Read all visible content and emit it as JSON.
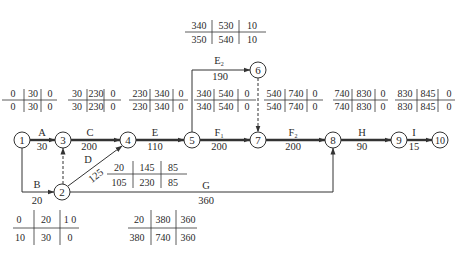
{
  "diagram": {
    "type": "activity-on-arrow network with time parameters",
    "nodes": [
      {
        "id": "1",
        "x": 22,
        "y": 140
      },
      {
        "id": "2",
        "x": 62,
        "y": 192
      },
      {
        "id": "3",
        "x": 63,
        "y": 140
      },
      {
        "id": "4",
        "x": 128,
        "y": 140
      },
      {
        "id": "5",
        "x": 192,
        "y": 140
      },
      {
        "id": "6",
        "x": 258,
        "y": 70
      },
      {
        "id": "7",
        "x": 258,
        "y": 140
      },
      {
        "id": "8",
        "x": 333,
        "y": 140
      },
      {
        "id": "9",
        "x": 399,
        "y": 140
      },
      {
        "id": "10",
        "x": 440,
        "y": 140
      }
    ],
    "activities": [
      {
        "name": "A",
        "duration": "30",
        "from": "1",
        "to": "3",
        "critical": true
      },
      {
        "name": "B",
        "duration": "20",
        "from": "1",
        "to": "2",
        "critical": false
      },
      {
        "name": "C",
        "duration": "200",
        "from": "3",
        "to": "4",
        "critical": true
      },
      {
        "name": "D",
        "duration": "125",
        "from": "2",
        "to": "4",
        "critical": false
      },
      {
        "name": "E",
        "duration": "110",
        "from": "4",
        "to": "5",
        "critical": true
      },
      {
        "name": "E2",
        "duration": "190",
        "from": "5",
        "to": "6",
        "critical": false
      },
      {
        "name": "F1",
        "duration": "200",
        "from": "5",
        "to": "7",
        "critical": true
      },
      {
        "name": "F2",
        "duration": "200",
        "from": "7",
        "to": "8",
        "critical": true
      },
      {
        "name": "G",
        "duration": "360",
        "from": "2",
        "to": "8",
        "critical": false
      },
      {
        "name": "H",
        "duration": "90",
        "from": "8",
        "to": "9",
        "critical": true
      },
      {
        "name": "I",
        "duration": "15",
        "from": "9",
        "to": "10",
        "critical": true
      }
    ],
    "dummies": [
      {
        "from": "2",
        "to": "3"
      },
      {
        "from": "6",
        "to": "7"
      }
    ],
    "time_tables": [
      {
        "activity": "A",
        "top": [
          "0",
          "30",
          "0"
        ],
        "bottom": [
          "0",
          "30",
          "0"
        ]
      },
      {
        "activity": "C",
        "top": [
          "30",
          "230",
          "0"
        ],
        "bottom": [
          "30",
          "230",
          "0"
        ]
      },
      {
        "activity": "E",
        "top": [
          "230",
          "340",
          "0"
        ],
        "bottom": [
          "230",
          "340",
          "0"
        ]
      },
      {
        "activity": "F1",
        "top": [
          "340",
          "540",
          "0"
        ],
        "bottom": [
          "340",
          "540",
          "0"
        ]
      },
      {
        "activity": "F2",
        "top": [
          "540",
          "740",
          "0"
        ],
        "bottom": [
          "540",
          "740",
          "0"
        ]
      },
      {
        "activity": "H",
        "top": [
          "740",
          "830",
          "0"
        ],
        "bottom": [
          "740",
          "830",
          "0"
        ]
      },
      {
        "activity": "I",
        "top": [
          "830",
          "845",
          "0"
        ],
        "bottom": [
          "830",
          "845",
          "0"
        ]
      },
      {
        "activity": "E2",
        "top": [
          "340",
          "530",
          "10"
        ],
        "bottom": [
          "350",
          "540",
          "10"
        ]
      },
      {
        "activity": "D",
        "top": [
          "20",
          "145",
          "85"
        ],
        "bottom": [
          "105",
          "230",
          "85"
        ]
      },
      {
        "activity": "B",
        "top": [
          "0",
          "20",
          "1 0"
        ],
        "bottom": [
          "10",
          "30",
          "0"
        ]
      },
      {
        "activity": "G",
        "top": [
          "20",
          "380",
          "360"
        ],
        "bottom": [
          "380",
          "740",
          "360"
        ]
      }
    ]
  },
  "labels": {
    "A": "A",
    "A_dur": "30",
    "B": "B",
    "B_dur": "20",
    "C": "C",
    "C_dur": "200",
    "D": "D",
    "D_dur": "125",
    "E": "E",
    "E_dur": "110",
    "E2": "E",
    "E2_sub": "2",
    "E2_dur": "190",
    "F1": "F",
    "F1_sub": "1",
    "F1_dur": "200",
    "F2": "F",
    "F2_sub": "2",
    "F2_dur": "200",
    "G": "G",
    "G_dur": "360",
    "H": "H",
    "H_dur": "90",
    "I": "I",
    "I_dur": "15"
  },
  "node_labels": {
    "n1": "1",
    "n2": "2",
    "n3": "3",
    "n4": "4",
    "n5": "5",
    "n6": "6",
    "n7": "7",
    "n8": "8",
    "n9": "9",
    "n10": "10"
  },
  "tables": {
    "tA": {
      "a": "0",
      "b": "30",
      "c": "0",
      "d": "0",
      "e": "30",
      "f": "0"
    },
    "tC": {
      "a": "30",
      "b": "230",
      "c": "0",
      "d": "30",
      "e": "230",
      "f": "0"
    },
    "tE": {
      "a": "230",
      "b": "340",
      "c": "0",
      "d": "230",
      "e": "340",
      "f": "0"
    },
    "tF1": {
      "a": "340",
      "b": "540",
      "c": "0",
      "d": "340",
      "e": "540",
      "f": "0"
    },
    "tF2": {
      "a": "540",
      "b": "740",
      "c": "0",
      "d": "540",
      "e": "740",
      "f": "0"
    },
    "tH": {
      "a": "740",
      "b": "830",
      "c": "0",
      "d": "740",
      "e": "830",
      "f": "0"
    },
    "tI": {
      "a": "830",
      "b": "845",
      "c": "0",
      "d": "830",
      "e": "845",
      "f": "0"
    },
    "tE2": {
      "a": "340",
      "b": "530",
      "c": "10",
      "d": "350",
      "e": "540",
      "f": "10"
    },
    "tD": {
      "a": "20",
      "b": "145",
      "c": "85",
      "d": "105",
      "e": "230",
      "f": "85"
    },
    "tB": {
      "a": "0",
      "b": "20",
      "c": "1 0",
      "d": "10",
      "e": "30",
      "f": "0"
    },
    "tG": {
      "a": "20",
      "b": "380",
      "c": "360",
      "d": "380",
      "e": "740",
      "f": "360"
    }
  },
  "colors": {
    "line": "#333333",
    "critical_line": "#555555",
    "text": "#2a2a2a",
    "background": "#ffffff"
  }
}
